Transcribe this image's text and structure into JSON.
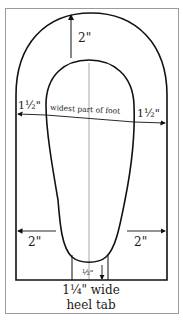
{
  "diagram": {
    "labels": {
      "top_margin": "2\"",
      "left_width": "1½\"",
      "right_width": "1½\"",
      "widest": "widest part of foot",
      "left_lower": "2\"",
      "right_lower": "2\"",
      "heel_gap": "½\"",
      "heel_tab_line1": "1¼\" wide",
      "heel_tab_line2": "heel tab"
    },
    "colors": {
      "outline": "#111111",
      "guide": "#9a9a9a",
      "frame": "#9a9a9a"
    }
  }
}
